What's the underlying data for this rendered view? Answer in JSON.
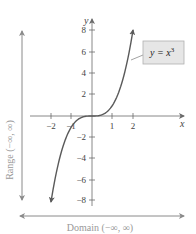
{
  "chart_data": {
    "type": "line",
    "title": "",
    "function": "y = x^3",
    "series": [
      {
        "name": "y = x^3",
        "x": [
          -2,
          -1.75,
          -1.5,
          -1.25,
          -1,
          -0.75,
          -0.5,
          -0.25,
          0,
          0.25,
          0.5,
          0.75,
          1,
          1.25,
          1.5,
          1.75,
          2
        ],
        "y": [
          -8,
          -5.36,
          -3.375,
          -1.95,
          -1,
          -0.42,
          -0.125,
          -0.016,
          0,
          0.016,
          0.125,
          0.42,
          1,
          1.95,
          3.375,
          5.36,
          8
        ]
      }
    ],
    "xlabel": "x",
    "ylabel": "y",
    "xlim": [
      -2.5,
      2.5
    ],
    "ylim": [
      -8.5,
      8.5
    ],
    "x_ticks": [
      -2,
      -1,
      1,
      2
    ],
    "y_ticks": [
      8,
      6,
      4,
      2,
      -2,
      -4,
      -6,
      -8
    ],
    "x_tick_labels": [
      "−2",
      "−1",
      "1",
      "2"
    ],
    "y_tick_labels": [
      "8",
      "6",
      "4",
      "2",
      "−2",
      "−4",
      "−6",
      "−8"
    ],
    "grid": false,
    "legend": {
      "text": "y = x³",
      "position": "upper right callout box"
    },
    "annotations": [
      {
        "text": "Range (−∞, ∞)",
        "orientation": "vertical",
        "position": "left"
      },
      {
        "text": "Domain (−∞, ∞)",
        "orientation": "horizontal",
        "position": "bottom"
      }
    ]
  },
  "labels": {
    "x_axis": "x",
    "y_axis": "y",
    "equation_prefix": "y = x",
    "equation_exponent": "3",
    "range": "Range (−∞, ∞)",
    "domain": "Domain (−∞, ∞)",
    "x_ticks": [
      "−2",
      "−1",
      "1",
      "2"
    ],
    "y_ticks": [
      "8",
      "6",
      "4",
      "2",
      "−2",
      "−4",
      "−6",
      "−8"
    ]
  },
  "colors": {
    "curve": "#5a5a5a",
    "axes": "#6a6a6a",
    "range_domain_arrows": "#8a8a8a",
    "label_box_fill": "#e6e6e6",
    "label_box_stroke": "#b0b0b0",
    "side_text": "#999999"
  }
}
